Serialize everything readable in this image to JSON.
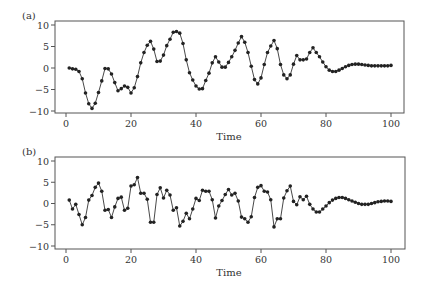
{
  "figure": {
    "panels": [
      {
        "id": "a",
        "label": "(a)",
        "xlabel": "Time"
      },
      {
        "id": "b",
        "label": "(b)",
        "xlabel": "Time"
      }
    ],
    "colors": {
      "line": "#333333",
      "marker": "#222222",
      "frame": "#555555",
      "text": "#333333"
    }
  },
  "chart_data": [
    {
      "type": "line",
      "title": "(a)",
      "xlabel": "Time",
      "ylabel": "",
      "xlim": [
        0,
        100
      ],
      "ylim": [
        -10,
        10
      ],
      "xticks": [
        0,
        20,
        40,
        60,
        80,
        100
      ],
      "yticks": [
        10,
        5,
        0,
        -5,
        -10
      ],
      "xtick_labels": [
        "0",
        "20",
        "40",
        "60",
        "80",
        "100"
      ],
      "ytick_labels": [
        "10",
        "5",
        "0",
        "−5",
        "−10"
      ],
      "grid": false,
      "markers": true,
      "x": [
        1,
        2,
        3,
        4,
        5,
        6,
        7,
        8,
        9,
        10,
        11,
        12,
        13,
        14,
        15,
        16,
        17,
        18,
        19,
        20,
        21,
        22,
        23,
        24,
        25,
        26,
        27,
        28,
        29,
        30,
        31,
        32,
        33,
        34,
        35,
        36,
        37,
        38,
        39,
        40,
        41,
        42,
        43,
        44,
        45,
        46,
        47,
        48,
        49,
        50,
        51,
        52,
        53,
        54,
        55,
        56,
        57,
        58,
        59,
        60,
        61,
        62,
        63,
        64,
        65,
        66,
        67,
        68,
        69,
        70,
        71,
        72,
        73,
        74,
        75,
        76,
        77,
        78,
        79,
        80,
        81,
        82,
        83,
        84,
        85,
        86,
        87,
        88,
        89,
        90,
        91,
        92,
        93,
        94,
        95,
        96,
        97,
        98,
        99,
        100
      ],
      "values": [
        0.0,
        -0.2,
        -0.3,
        -0.8,
        -2.5,
        -5.8,
        -8.3,
        -9.4,
        -8.2,
        -5.7,
        -3.0,
        -0.1,
        -0.2,
        -1.4,
        -3.4,
        -5.3,
        -4.8,
        -4.2,
        -4.5,
        -5.8,
        -4.6,
        -2.0,
        1.2,
        3.6,
        5.3,
        6.2,
        4.4,
        1.5,
        1.6,
        3.0,
        5.2,
        6.7,
        8.3,
        8.5,
        8.1,
        5.7,
        1.9,
        -1.1,
        -2.8,
        -4.2,
        -4.9,
        -4.8,
        -2.9,
        -1.2,
        1.2,
        2.6,
        1.4,
        0.2,
        0.2,
        1.3,
        2.6,
        4.1,
        5.8,
        7.3,
        6.0,
        3.6,
        0.4,
        -2.7,
        -3.7,
        -2.3,
        0.8,
        3.6,
        5.1,
        6.4,
        4.5,
        0.8,
        -1.6,
        -2.5,
        -1.6,
        0.9,
        2.9,
        1.9,
        1.9,
        2.1,
        3.6,
        4.7,
        3.6,
        2.6,
        1.4,
        0.3,
        -0.5,
        -0.8,
        -0.8,
        -0.5,
        -0.1,
        0.3,
        0.6,
        0.8,
        0.9,
        0.9,
        0.8,
        0.7,
        0.6,
        0.5,
        0.5,
        0.5,
        0.5,
        0.5,
        0.5,
        0.6
      ]
    },
    {
      "type": "line",
      "title": "(b)",
      "xlabel": "Time",
      "ylabel": "",
      "xlim": [
        0,
        100
      ],
      "ylim": [
        -10,
        10
      ],
      "xticks": [
        0,
        20,
        40,
        60,
        80,
        100
      ],
      "yticks": [
        10,
        5,
        0,
        -5,
        -10
      ],
      "xtick_labels": [
        "0",
        "20",
        "40",
        "60",
        "80",
        "100"
      ],
      "ytick_labels": [
        "10",
        "5",
        "0",
        "−5",
        "−10"
      ],
      "grid": false,
      "markers": true,
      "x": [
        1,
        2,
        3,
        4,
        5,
        6,
        7,
        8,
        9,
        10,
        11,
        12,
        13,
        14,
        15,
        16,
        17,
        18,
        19,
        20,
        21,
        22,
        23,
        24,
        25,
        26,
        27,
        28,
        29,
        30,
        31,
        32,
        33,
        34,
        35,
        36,
        37,
        38,
        39,
        40,
        41,
        42,
        43,
        44,
        45,
        46,
        47,
        48,
        49,
        50,
        51,
        52,
        53,
        54,
        55,
        56,
        57,
        58,
        59,
        60,
        61,
        62,
        63,
        64,
        65,
        66,
        67,
        68,
        69,
        70,
        71,
        72,
        73,
        74,
        75,
        76,
        77,
        78,
        79,
        80,
        81,
        82,
        83,
        84,
        85,
        86,
        87,
        88,
        89,
        90,
        91,
        92,
        93,
        94,
        95,
        96,
        97,
        98,
        99,
        100
      ],
      "values": [
        0.8,
        -1.3,
        -0.2,
        -2.6,
        -5.0,
        -3.3,
        0.8,
        1.9,
        3.8,
        4.8,
        2.9,
        -1.6,
        -1.4,
        -3.3,
        -0.8,
        1.2,
        1.5,
        -1.6,
        -1.1,
        4.1,
        4.4,
        6.1,
        2.4,
        2.4,
        1.0,
        -4.4,
        -4.4,
        2.1,
        3.7,
        1.3,
        3.1,
        2.0,
        -1.6,
        -1.0,
        -5.3,
        -4.2,
        -2.3,
        -3.6,
        -1.3,
        1.2,
        0.7,
        3.1,
        2.9,
        2.9,
        0.9,
        -3.4,
        -0.6,
        0.7,
        2.1,
        3.3,
        2.0,
        2.4,
        0.6,
        -3.2,
        -3.6,
        -4.4,
        -3.1,
        1.4,
        3.8,
        4.2,
        2.9,
        2.7,
        0.9,
        -5.5,
        -3.6,
        -3.6,
        1.3,
        3.0,
        4.1,
        0.5,
        -0.3,
        1.6,
        0.9,
        1.7,
        -0.2,
        -1.3,
        -2.0,
        -2.0,
        -1.3,
        -0.6,
        0.2,
        0.8,
        1.2,
        1.4,
        1.4,
        1.2,
        0.9,
        0.6,
        0.3,
        0.0,
        -0.2,
        -0.2,
        -0.2,
        0.0,
        0.2,
        0.4,
        0.5,
        0.6,
        0.6,
        0.5
      ]
    }
  ]
}
